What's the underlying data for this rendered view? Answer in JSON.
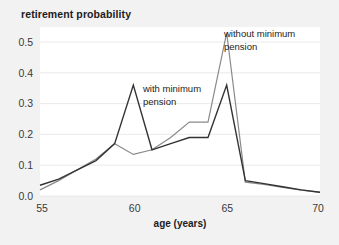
{
  "figure": {
    "title": "retirement probability",
    "background_color": "#f2f2f2",
    "plot_background_color": "#ffffff",
    "gridline_color": "#e4e4e4"
  },
  "axes": {
    "x_title": "age (years)",
    "x_ticks": [
      "55",
      "60",
      "65",
      "70"
    ],
    "y_ticks": [
      "0.0",
      "0.1",
      "0.2",
      "0.3",
      "0.4",
      "0.5"
    ]
  },
  "annotations": {
    "with_pension": "with minimum\npension",
    "with_pension_line1": "with minimum",
    "with_pension_line2": "pension",
    "without_pension_line1": "without minimum",
    "without_pension_line2": "pension"
  },
  "chart_data": {
    "type": "line",
    "title": "retirement probability",
    "xlabel": "age (years)",
    "ylabel": "retirement probability",
    "xlim": [
      55,
      70
    ],
    "ylim": [
      0.0,
      0.55
    ],
    "grid": true,
    "legend": "inline-annotations",
    "x": [
      55,
      56,
      57,
      58,
      59,
      60,
      61,
      62,
      63,
      64,
      65,
      66,
      67,
      68,
      69,
      70
    ],
    "series": [
      {
        "name": "with minimum pension",
        "color": "#333333",
        "values": [
          0.035,
          0.055,
          0.085,
          0.115,
          0.17,
          0.36,
          0.15,
          0.17,
          0.19,
          0.19,
          0.36,
          0.05,
          0.04,
          0.03,
          0.02,
          0.012
        ]
      },
      {
        "name": "without minimum pension",
        "color": "#8a8a8a",
        "values": [
          0.02,
          0.05,
          0.085,
          0.12,
          0.17,
          0.135,
          0.15,
          0.19,
          0.24,
          0.24,
          0.53,
          0.045,
          0.038,
          0.028,
          0.019,
          0.012
        ]
      }
    ]
  }
}
